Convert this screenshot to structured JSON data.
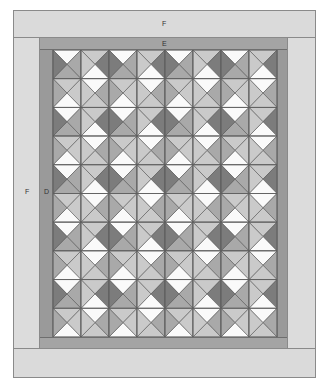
{
  "labels": {
    "outer_border_top": "F",
    "inner_border_top": "E",
    "outer_border_left": "F",
    "inner_border_left": "D"
  },
  "colors": {
    "outer_border": "#dadada",
    "inner_border": "#a4a4a4",
    "side_border": "#9a9a9a",
    "outline": "#5e5e5e",
    "white": "#fafafa",
    "light": "#cacaca",
    "mid": "#a9a9a9",
    "dark": "#7c7c7c"
  },
  "grid": {
    "columns": 8,
    "rows": 10,
    "block_size_px": 28,
    "repeat_tile": [
      [
        {
          "top": "white",
          "right": "mid",
          "bottom": "mid",
          "left": "dark"
        },
        {
          "top": "light",
          "right": "dark",
          "bottom": "white",
          "left": "light"
        }
      ],
      [
        {
          "top": "light",
          "right": "light",
          "bottom": "white",
          "left": "mid"
        },
        {
          "top": "white",
          "right": "mid",
          "bottom": "light",
          "left": "light"
        }
      ]
    ]
  }
}
